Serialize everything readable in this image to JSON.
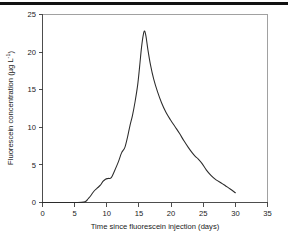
{
  "figure": {
    "name": "fluorescein-breakthrough-curve",
    "background_color": "#ffffff",
    "rule_color": "#111111",
    "curve_color": "#2b2b2b",
    "axis_color": "#3a3a3a",
    "frame_color": "#8a8a8a"
  },
  "chart_data": {
    "type": "line",
    "title": "",
    "subtitle": "",
    "xlabel": "Time since fluorescein injection (days)",
    "ylabel_plain": "Fluorescein concentration (µg L⁻¹)",
    "ylabel_main": "Fluorescein concentration (µg  L",
    "ylabel_superscript": "-1",
    "ylabel_tail": ")",
    "xlim": [
      0,
      35
    ],
    "ylim": [
      0,
      25
    ],
    "xticks": [
      0,
      5,
      10,
      15,
      20,
      25,
      30,
      35
    ],
    "xtick_labels": [
      "0",
      "5",
      "10",
      "15",
      "20",
      "25",
      "30",
      "35"
    ],
    "yticks": [
      0,
      5,
      10,
      15,
      20,
      25
    ],
    "ytick_labels": [
      "0",
      "5",
      "10",
      "15",
      "20",
      "25"
    ],
    "grid": false,
    "legend": null,
    "legend_position": "none",
    "series": [
      {
        "name": "Fluorescein concentration",
        "x": [
          0.0,
          2.0,
          4.0,
          5.5,
          6.4,
          6.8,
          7.1,
          7.5,
          8.0,
          8.5,
          9.0,
          9.4,
          9.8,
          10.2,
          10.7,
          11.2,
          11.8,
          12.3,
          12.8,
          13.2,
          13.6,
          14.0,
          14.4,
          14.8,
          15.1,
          15.4,
          15.7,
          15.9,
          16.1,
          16.4,
          16.8,
          17.3,
          17.9,
          18.5,
          19.2,
          19.9,
          20.6,
          21.3,
          22.0,
          22.7,
          23.3,
          23.8,
          24.2,
          24.8,
          25.5,
          26.2,
          27.0,
          27.8,
          28.5,
          29.2,
          30.0
        ],
        "y": [
          0.0,
          0.0,
          0.0,
          0.0,
          0.05,
          0.2,
          0.5,
          0.9,
          1.5,
          1.9,
          2.3,
          2.8,
          3.1,
          3.2,
          3.3,
          4.2,
          5.4,
          6.6,
          7.3,
          8.6,
          10.2,
          11.6,
          13.4,
          15.6,
          18.0,
          20.6,
          22.4,
          22.8,
          22.1,
          20.3,
          18.3,
          16.4,
          14.7,
          13.3,
          12.0,
          11.0,
          10.1,
          9.2,
          8.2,
          7.3,
          6.6,
          6.1,
          5.8,
          5.2,
          4.3,
          3.6,
          3.0,
          2.6,
          2.2,
          1.8,
          1.3
        ]
      }
    ],
    "peak": {
      "x": 15.9,
      "y": 22.8
    }
  }
}
